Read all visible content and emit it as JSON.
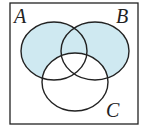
{
  "diagram": {
    "type": "venn",
    "sets": [
      {
        "name": "A",
        "label": "A"
      },
      {
        "name": "B",
        "label": "B"
      },
      {
        "name": "C",
        "label": "C"
      }
    ],
    "shaded_region": "(A ∪ B) − C",
    "colors": {
      "shade": "#cfe9f1",
      "stroke": "#222222",
      "background": "#ffffff"
    }
  }
}
